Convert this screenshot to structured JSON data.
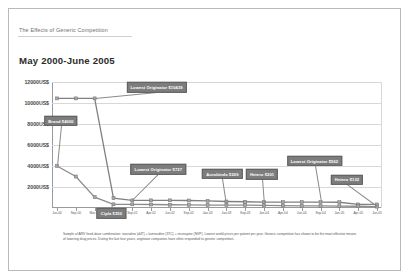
{
  "document": {
    "eyebrow": "The Effects of Generic Competition",
    "title": "May 2000-June 2005"
  },
  "footnote": "Sample of ARV fixed-dose combination: stavudine (d4T) + lamivudine (3TC) + nevirapine (NVP). Lowest world prices per patient per year. Generic competition has shown to be the most effective means of lowering drug prices. During the last four years, originator companies have often responded to generic competition.",
  "chart_data": {
    "type": "line",
    "title": "May 2000-June 2005",
    "xlabel": "",
    "ylabel": "US$",
    "ylim": [
      0,
      12000
    ],
    "yticks": [
      2000,
      4000,
      6000,
      8000,
      10000,
      12000
    ],
    "ytick_labels": [
      "2000US$",
      "4000US$",
      "6000US$",
      "8000US$",
      "10000US$",
      "12000US$"
    ],
    "grid": true,
    "legend_position": "none",
    "x": [
      "Jun-00",
      "Sep-00",
      "Mar-01",
      "Jun-01",
      "Sep-01",
      "Apr-02",
      "Jun-02",
      "Sep-02",
      "Jan-03",
      "Jun-03",
      "Sep-03",
      "Jan-04",
      "Apr-04",
      "Jun-04",
      "Sep-04",
      "Jan-05",
      "Apr-05",
      "Jun-05"
    ],
    "series": [
      {
        "name": "Lowest originator price",
        "values": [
          10439,
          10439,
          10439,
          931,
          727,
          727,
          727,
          712,
          675,
          620,
          594,
          562,
          562,
          562,
          562,
          549,
          339,
          339
        ]
      },
      {
        "name": "Lowest generic price",
        "values": [
          4000,
          3000,
          1038,
          350,
          350,
          331,
          309,
          295,
          281,
          275,
          270,
          252,
          232,
          209,
          201,
          182,
          168,
          132
        ]
      }
    ],
    "annotations": [
      {
        "label": "Lowest Originator $10439",
        "x_index": 2,
        "series": 0
      },
      {
        "label": "Brand $4000",
        "x_index": 0,
        "series": 1
      },
      {
        "label": "Cipla $350",
        "x_index": 3,
        "series": 1
      },
      {
        "label": "Lowest Originator $727",
        "x_index": 4,
        "series": 0
      },
      {
        "label": "Aurobindo $209",
        "x_index": 9,
        "series": 1
      },
      {
        "label": "Hetero $201",
        "x_index": 11,
        "series": 1
      },
      {
        "label": "Lowest Originator $562",
        "x_index": 14,
        "series": 0
      },
      {
        "label": "Hetero $132",
        "x_index": 17,
        "series": 1
      }
    ]
  }
}
